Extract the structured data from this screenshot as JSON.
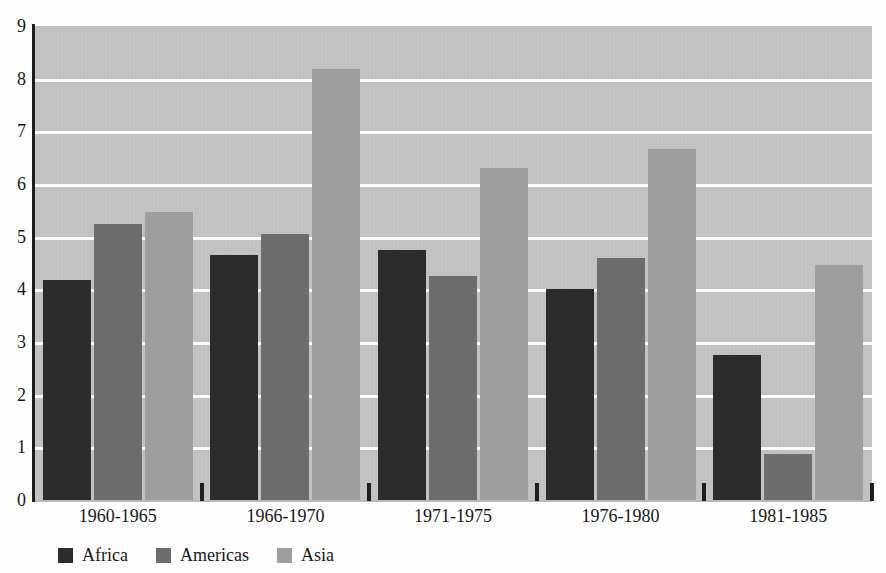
{
  "chart_data": {
    "type": "bar",
    "title": "",
    "subtitle": "",
    "xlabel": "",
    "ylabel": "",
    "categories": [
      "1960-1965",
      "1966-1970",
      "1971-1975",
      "1976-1980",
      "1981-1985"
    ],
    "series": [
      {
        "name": "Africa",
        "color": "#2c2c2c",
        "values": [
          4.17,
          4.65,
          4.75,
          4.0,
          2.75
        ]
      },
      {
        "name": "Americas",
        "color": "#6d6d6d",
        "values": [
          5.25,
          5.05,
          4.25,
          4.6,
          0.88
        ]
      },
      {
        "name": "Asia",
        "color": "#9e9e9e",
        "values": [
          5.47,
          8.18,
          6.3,
          6.67,
          4.47
        ]
      }
    ],
    "ylim": [
      0,
      9
    ],
    "ytick_labels": [
      "9",
      "8",
      "7",
      "6",
      "5",
      "4",
      "3",
      "2",
      "1",
      "0"
    ],
    "ytick_values": [
      9,
      8,
      7,
      6,
      5,
      4,
      3,
      2,
      1,
      0
    ],
    "gridlines": [
      8,
      7,
      6,
      5,
      4,
      3,
      2,
      1
    ],
    "grid": true,
    "legend_position": "bottom-left",
    "plot_background": "#c5c5c5",
    "gridline_color": "#fbfbfb",
    "axis_color": "#1d1d1d",
    "page_background": "#ffffff"
  },
  "legend": {
    "entries": [
      {
        "label": "Africa"
      },
      {
        "label": "Americas"
      },
      {
        "label": "Asia"
      }
    ]
  },
  "axes": {
    "y": {
      "labels": [
        "9",
        "8",
        "7",
        "6",
        "5",
        "4",
        "3",
        "2",
        "1",
        "0"
      ]
    },
    "x": {
      "labels": [
        "1960-1965",
        "1966-1970",
        "1971-1975",
        "1976-1980",
        "1981-1985"
      ]
    }
  }
}
